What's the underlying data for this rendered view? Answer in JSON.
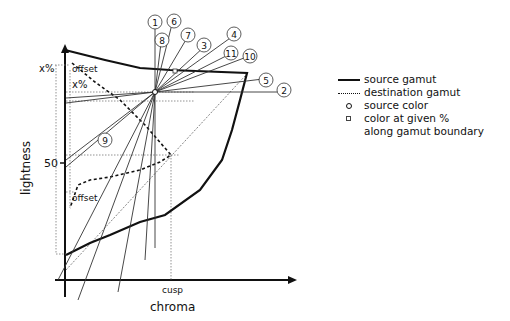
{
  "diagram": {
    "axes": {
      "x_label": "chroma",
      "y_label": "lightness",
      "y_tick": "50",
      "x_tick": "cusp"
    },
    "annotations": {
      "x_percent_outer": "x%",
      "x_percent_inner": "x%",
      "offset_top": "offset",
      "offset_bottom": "offset"
    },
    "numbered_lines": [
      "1",
      "2",
      "3",
      "4",
      "5",
      "6",
      "7",
      "8",
      "9",
      "10",
      "11"
    ]
  },
  "legend": {
    "items": [
      {
        "symbol": "solid-line",
        "label": "source gamut"
      },
      {
        "symbol": "dashed-line",
        "label": "destination gamut"
      },
      {
        "symbol": "circle",
        "label": "source color"
      },
      {
        "symbol": "square",
        "label": "color at given %\nalong gamut boundary"
      }
    ]
  },
  "colors": {
    "line": "#111111",
    "thin_line": "#333333",
    "guide": "#777777"
  }
}
